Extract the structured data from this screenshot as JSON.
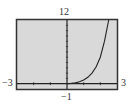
{
  "chart_data": {
    "type": "line",
    "title": "",
    "xlabel": "",
    "ylabel": "",
    "xlim": [
      -3,
      3
    ],
    "ylim": [
      -1,
      12
    ],
    "window_labels": {
      "xmin": "−3",
      "xmax": "3",
      "ymin": "−1",
      "ymax": "12"
    },
    "grid": false,
    "x_ticks": [
      -2,
      -1,
      0,
      1,
      2
    ],
    "y_ticks": [
      0,
      1,
      2,
      3,
      4,
      5,
      6,
      7,
      8,
      9,
      10,
      11
    ],
    "series": [
      {
        "name": "f(x)",
        "x": [
          0,
          0.25,
          0.5,
          0.75,
          1.0,
          1.25,
          1.5,
          1.75,
          2.0,
          2.25,
          2.5
        ],
        "y": [
          0,
          0.05,
          0.15,
          0.35,
          0.7,
          1.2,
          2.0,
          3.2,
          5.0,
          8.0,
          12.0
        ]
      }
    ]
  },
  "colors": {
    "plot_bg": "#d9d9d9",
    "frame": "#333333",
    "axis": "#222222",
    "curve": "#222222"
  }
}
